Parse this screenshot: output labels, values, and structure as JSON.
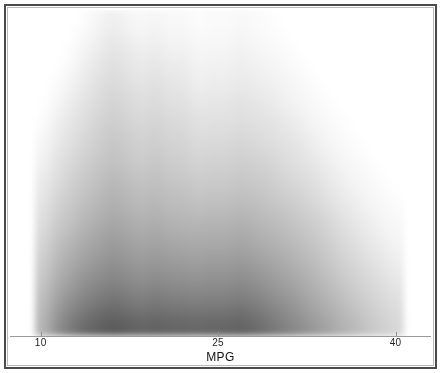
{
  "figure": {
    "background_color": "#ffffff",
    "frame_color": "#4a4a4a",
    "axis_color": "#9a9a9a"
  },
  "axis": {
    "title": "MPG",
    "ticks": [
      {
        "label": "10",
        "value": 10
      },
      {
        "label": "25",
        "value": 25
      },
      {
        "label": "40",
        "value": 40
      }
    ]
  },
  "chart_data": {
    "type": "heatmap",
    "title": "",
    "subtitle": "",
    "xlabel": "MPG",
    "ylabel": "",
    "xlim": [
      7.4,
      43.0
    ],
    "ylim": [
      0,
      1
    ],
    "grid": false,
    "legend": null,
    "colormap": "grayscale-inverted",
    "color_low": "#ffffff",
    "color_high": "#5b5b5b",
    "note": "Blurred grayscale density image of MPG distribution; darker = higher density. Columns are MPG bins, rows are stacked density levels from top (low) to bottom (high).",
    "x_bin_edges": [
      9.5,
      10.7,
      11.9,
      13.1,
      14.3,
      15.5,
      16.7,
      17.9,
      19.1,
      20.3,
      21.5,
      22.7,
      23.9,
      25.1,
      26.3,
      27.5,
      28.7,
      29.9,
      31.1,
      32.3,
      33.5,
      34.7,
      35.9,
      37.1,
      38.3,
      39.5,
      40.7
    ],
    "x_bin_centers": [
      10.1,
      11.3,
      12.5,
      13.7,
      14.9,
      16.1,
      17.3,
      18.5,
      19.7,
      20.9,
      22.1,
      23.3,
      24.5,
      25.7,
      26.9,
      28.1,
      29.3,
      30.5,
      31.7,
      32.9,
      34.1,
      35.3,
      36.5,
      37.7,
      38.9,
      40.1
    ],
    "column_top_row": [
      15,
      11,
      6,
      4,
      2,
      1,
      2,
      3,
      2,
      3,
      3,
      5,
      4,
      4,
      3,
      4,
      5,
      6,
      7,
      8,
      9,
      10,
      11,
      13,
      14,
      15
    ],
    "rows": 16,
    "values": [
      [
        0.0,
        0.0,
        0.0,
        0.02,
        0.06,
        0.1,
        0.07,
        0.04,
        0.06,
        0.04,
        0.04,
        0.02,
        0.03,
        0.03,
        0.04,
        0.03,
        0.02,
        0.0,
        0.0,
        0.0,
        0.0,
        0.0,
        0.0,
        0.0,
        0.0,
        0.0
      ],
      [
        0.0,
        0.0,
        0.01,
        0.05,
        0.1,
        0.14,
        0.11,
        0.08,
        0.1,
        0.07,
        0.07,
        0.04,
        0.05,
        0.05,
        0.07,
        0.05,
        0.03,
        0.02,
        0.0,
        0.0,
        0.0,
        0.0,
        0.0,
        0.0,
        0.0,
        0.0
      ],
      [
        0.0,
        0.0,
        0.03,
        0.09,
        0.14,
        0.18,
        0.15,
        0.12,
        0.14,
        0.11,
        0.11,
        0.07,
        0.08,
        0.08,
        0.1,
        0.08,
        0.06,
        0.04,
        0.02,
        0.0,
        0.0,
        0.0,
        0.0,
        0.0,
        0.0,
        0.0
      ],
      [
        0.0,
        0.02,
        0.07,
        0.13,
        0.18,
        0.22,
        0.19,
        0.16,
        0.18,
        0.15,
        0.14,
        0.1,
        0.11,
        0.11,
        0.13,
        0.11,
        0.09,
        0.07,
        0.04,
        0.02,
        0.0,
        0.0,
        0.0,
        0.0,
        0.0,
        0.0
      ],
      [
        0.0,
        0.05,
        0.11,
        0.17,
        0.22,
        0.26,
        0.23,
        0.2,
        0.22,
        0.19,
        0.18,
        0.14,
        0.15,
        0.15,
        0.17,
        0.15,
        0.13,
        0.1,
        0.07,
        0.04,
        0.02,
        0.0,
        0.0,
        0.0,
        0.0,
        0.0
      ],
      [
        0.02,
        0.09,
        0.15,
        0.21,
        0.26,
        0.3,
        0.27,
        0.24,
        0.26,
        0.23,
        0.22,
        0.18,
        0.19,
        0.19,
        0.21,
        0.19,
        0.17,
        0.14,
        0.11,
        0.07,
        0.04,
        0.02,
        0.0,
        0.0,
        0.0,
        0.0
      ],
      [
        0.05,
        0.13,
        0.19,
        0.25,
        0.3,
        0.34,
        0.31,
        0.28,
        0.3,
        0.27,
        0.26,
        0.22,
        0.23,
        0.23,
        0.25,
        0.23,
        0.21,
        0.18,
        0.15,
        0.11,
        0.07,
        0.04,
        0.02,
        0.0,
        0.0,
        0.0
      ],
      [
        0.08,
        0.17,
        0.23,
        0.29,
        0.34,
        0.38,
        0.35,
        0.32,
        0.34,
        0.31,
        0.3,
        0.27,
        0.28,
        0.28,
        0.3,
        0.28,
        0.26,
        0.22,
        0.19,
        0.15,
        0.11,
        0.07,
        0.04,
        0.02,
        0.0,
        0.0
      ],
      [
        0.12,
        0.21,
        0.28,
        0.34,
        0.39,
        0.43,
        0.4,
        0.37,
        0.39,
        0.36,
        0.35,
        0.32,
        0.33,
        0.33,
        0.35,
        0.33,
        0.31,
        0.27,
        0.24,
        0.2,
        0.15,
        0.11,
        0.07,
        0.04,
        0.02,
        0.0
      ],
      [
        0.16,
        0.26,
        0.33,
        0.39,
        0.44,
        0.48,
        0.45,
        0.42,
        0.44,
        0.41,
        0.4,
        0.38,
        0.39,
        0.39,
        0.41,
        0.39,
        0.36,
        0.33,
        0.29,
        0.25,
        0.2,
        0.15,
        0.11,
        0.07,
        0.04,
        0.02
      ],
      [
        0.2,
        0.31,
        0.38,
        0.45,
        0.5,
        0.54,
        0.51,
        0.48,
        0.5,
        0.47,
        0.46,
        0.45,
        0.46,
        0.46,
        0.48,
        0.45,
        0.42,
        0.39,
        0.35,
        0.31,
        0.26,
        0.2,
        0.15,
        0.11,
        0.07,
        0.04
      ],
      [
        0.25,
        0.37,
        0.45,
        0.52,
        0.57,
        0.61,
        0.58,
        0.55,
        0.57,
        0.54,
        0.53,
        0.52,
        0.53,
        0.53,
        0.55,
        0.52,
        0.49,
        0.45,
        0.41,
        0.36,
        0.31,
        0.25,
        0.2,
        0.15,
        0.11,
        0.07
      ],
      [
        0.3,
        0.43,
        0.52,
        0.59,
        0.64,
        0.68,
        0.65,
        0.62,
        0.64,
        0.62,
        0.61,
        0.6,
        0.61,
        0.61,
        0.63,
        0.6,
        0.56,
        0.52,
        0.47,
        0.42,
        0.36,
        0.3,
        0.25,
        0.2,
        0.15,
        0.11
      ],
      [
        0.35,
        0.5,
        0.6,
        0.68,
        0.73,
        0.77,
        0.74,
        0.71,
        0.73,
        0.71,
        0.7,
        0.69,
        0.7,
        0.7,
        0.72,
        0.69,
        0.64,
        0.59,
        0.54,
        0.48,
        0.42,
        0.36,
        0.3,
        0.25,
        0.2,
        0.15
      ],
      [
        0.4,
        0.58,
        0.7,
        0.78,
        0.84,
        0.88,
        0.85,
        0.82,
        0.84,
        0.82,
        0.81,
        0.8,
        0.81,
        0.81,
        0.83,
        0.79,
        0.74,
        0.68,
        0.62,
        0.55,
        0.49,
        0.42,
        0.36,
        0.3,
        0.25,
        0.2
      ],
      [
        0.44,
        0.66,
        0.8,
        0.9,
        0.96,
        1.0,
        0.97,
        0.94,
        0.96,
        0.94,
        0.93,
        0.92,
        0.93,
        0.93,
        0.95,
        0.9,
        0.84,
        0.77,
        0.7,
        0.63,
        0.56,
        0.48,
        0.42,
        0.35,
        0.29,
        0.24
      ]
    ]
  }
}
